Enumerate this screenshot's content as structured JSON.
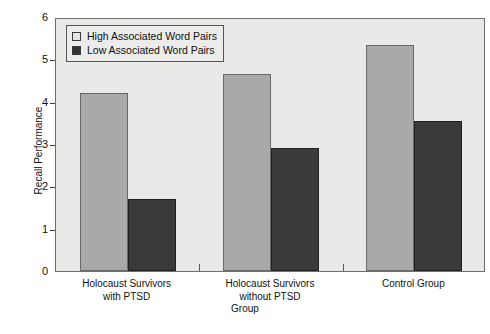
{
  "chart_data": {
    "type": "bar",
    "title": "",
    "xlabel": "Group",
    "ylabel": "Recall Performance",
    "categories": [
      "Holocaust Survivors\nwith PTSD",
      "Holocaust Survivors\nwithout PTSD",
      "Control Group"
    ],
    "series": [
      {
        "name": "High Associated Word Pairs",
        "values": [
          4.2,
          4.65,
          5.35
        ],
        "color": "#a9a9a7"
      },
      {
        "name": "Low Associated Word Pairs",
        "values": [
          1.7,
          2.9,
          3.55
        ],
        "color": "#3a3a3a"
      }
    ],
    "ylim": [
      0,
      6
    ],
    "yticks": [
      0,
      1,
      2,
      3,
      4,
      5,
      6
    ],
    "ytick_labels": [
      "0",
      "1",
      "2",
      "3",
      "4",
      "5",
      "6"
    ],
    "grid": false,
    "legend_position": "upper-left",
    "plot_background": "#e9e9e7",
    "frame_color": "#6f6f6f"
  },
  "legend": {
    "items": [
      {
        "label": "High Associated Word Pairs",
        "swatch": "legend-swatch-high"
      },
      {
        "label": "Low Associated Word Pairs",
        "swatch": "legend-swatch-low"
      }
    ]
  }
}
